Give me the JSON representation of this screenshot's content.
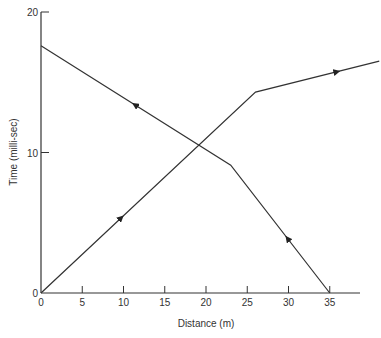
{
  "chart_data": {
    "type": "line",
    "title": "",
    "xlabel": "Distance (m)",
    "ylabel": "Time (milli-sec)",
    "xlim": [
      0,
      40
    ],
    "ylim": [
      0,
      20
    ],
    "x_ticks": [
      0,
      5,
      10,
      15,
      20,
      25,
      30,
      35
    ],
    "y_ticks": [
      0,
      10,
      20
    ],
    "grid": false,
    "legend": null,
    "series": [
      {
        "name": "forward",
        "x": [
          0,
          26,
          41
        ],
        "y": [
          0,
          14.3,
          16.5
        ],
        "arrows": "forward"
      },
      {
        "name": "reverse",
        "x": [
          35,
          23,
          0
        ],
        "y": [
          0,
          9.1,
          17.6
        ],
        "arrows": "forward"
      }
    ]
  }
}
